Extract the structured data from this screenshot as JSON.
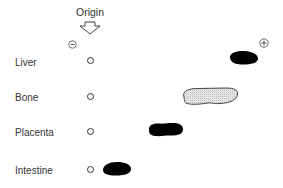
{
  "diagram": {
    "type": "electrophoresis-gel",
    "origin_label": "Origin",
    "poles": {
      "negative": "-",
      "positive": "+"
    },
    "lanes": [
      {
        "label": "Liver",
        "band_style": "solid-black",
        "migration": "farthest"
      },
      {
        "label": "Bone",
        "band_style": "stippled-gray",
        "migration": "far"
      },
      {
        "label": "Placenta",
        "band_style": "solid-black",
        "migration": "medium"
      },
      {
        "label": "Intestine",
        "band_style": "solid-black",
        "migration": "short"
      }
    ],
    "colors": {
      "band_solid": "#000000",
      "band_stipple": "#d9d9d9",
      "outline": "#333333",
      "background": "#ffffff"
    }
  }
}
